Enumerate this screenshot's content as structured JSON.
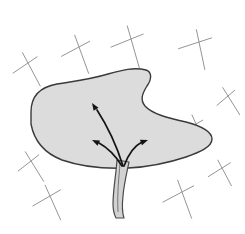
{
  "figure": {
    "alt_text": "A gray shaded leaf-like blade supported by a stalk, with three curved arrows radiating outward from the stalk junction into the blade, drawn over a background of scattered cross marks.",
    "background_color": "#ffffff"
  },
  "colors": {
    "blob_fill": "#dcdcdc",
    "blob_stroke": "#3a3a3a",
    "stem_fill": "#d2d2d2",
    "stem_stroke": "#4a4a4a",
    "arrow_stroke": "#141414",
    "mark_stroke": "#8f8f8f"
  },
  "shapes": {
    "blade": {
      "name": "leaf-blade",
      "path": "M 31 112 C 31 96, 40 87, 57 84 C 76 81, 92 79, 108 74 C 122 70, 134 67, 146 70 C 152 72, 152 79, 147 86 C 142 94, 140 100, 145 106 C 152 114, 168 118, 186 122 C 201 126, 212 131, 212 139 C 212 147, 200 152, 186 157 C 168 163, 148 167, 128 168 C 104 169, 82 167, 62 160 C 44 153, 34 140, 31 124 Z"
    },
    "stalk": {
      "name": "leaf-stalk",
      "path": "M 117 160 C 116 175, 113 190, 113 204 C 113 210, 114 214, 116 218 L 124 218 C 122 212, 122 205, 123 196 C 124 184, 127 172, 129 162 Z"
    },
    "stalk_center_line": {
      "name": "stalk-midrib",
      "path": "M 120 163 C 119 178, 117 192, 118 212"
    }
  },
  "arrows": [
    {
      "name": "arrow-upper-left",
      "label": "upward-left flow",
      "path": "M 123 166 C 118 150, 110 130, 97 110",
      "tip": {
        "x": 92,
        "y": 103
      },
      "angle_deg": 237
    },
    {
      "name": "arrow-mid-left",
      "label": "leftward flow",
      "path": "M 122 166 C 117 158, 110 149, 99 143",
      "tip": {
        "x": 92,
        "y": 140
      },
      "angle_deg": 205
    },
    {
      "name": "arrow-right",
      "label": "rightward flow",
      "path": "M 124 166 C 128 155, 134 146, 142 142",
      "tip": {
        "x": 148,
        "y": 140
      },
      "angle_deg": 340
    }
  ],
  "background_marks": [
    {
      "name": "cross-mark-1",
      "cx": 28,
      "cy": 63,
      "a1": 62,
      "a2": 146,
      "r1": 26,
      "r2": 20
    },
    {
      "name": "cross-mark-2",
      "cx": 79,
      "cy": 47,
      "a1": 70,
      "a2": 152,
      "r1": 28,
      "r2": 22
    },
    {
      "name": "cross-mark-3",
      "cx": 131,
      "cy": 39,
      "a1": 74,
      "a2": 158,
      "r1": 30,
      "r2": 24
    },
    {
      "name": "cross-mark-4",
      "cx": 199,
      "cy": 42,
      "a1": 78,
      "a2": 162,
      "r1": 28,
      "r2": 24
    },
    {
      "name": "cross-mark-5",
      "cx": 228,
      "cy": 96,
      "a1": 58,
      "a2": 140,
      "r1": 22,
      "r2": 16
    },
    {
      "name": "cross-mark-6",
      "cx": 31,
      "cy": 161,
      "a1": 58,
      "a2": 142,
      "r1": 24,
      "r2": 18
    },
    {
      "name": "cross-mark-7",
      "cx": 50,
      "cy": 196,
      "a1": 66,
      "a2": 150,
      "r1": 26,
      "r2": 22
    },
    {
      "name": "cross-mark-8",
      "cx": 182,
      "cy": 192,
      "a1": 70,
      "a2": 152,
      "r1": 28,
      "r2": 24
    },
    {
      "name": "cross-mark-9",
      "cx": 222,
      "cy": 168,
      "a1": 62,
      "a2": 148,
      "r1": 20,
      "r2": 18
    },
    {
      "name": "cross-mark-10",
      "cx": 196,
      "cy": 124,
      "a1": 66,
      "a2": 150,
      "r1": 22,
      "r2": 14
    }
  ]
}
